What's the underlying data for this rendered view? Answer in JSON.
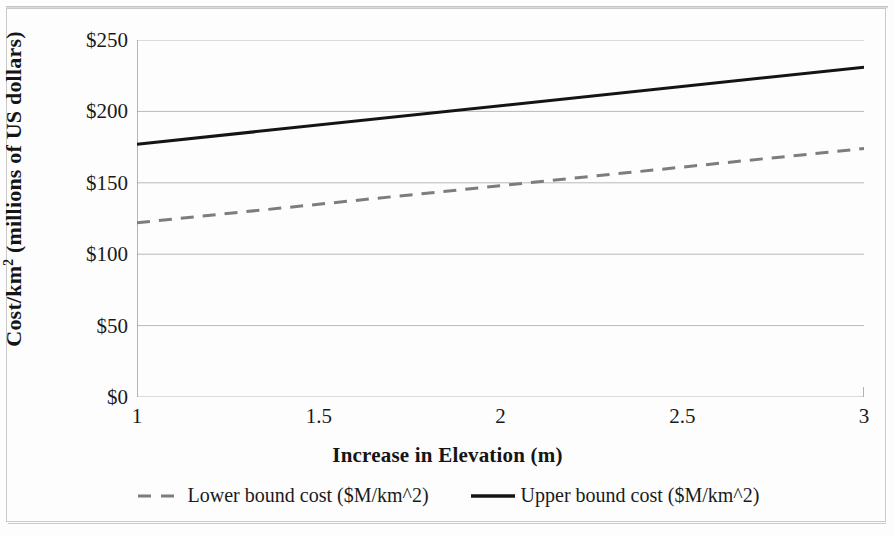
{
  "chart_data": {
    "type": "line",
    "title": "",
    "xlabel": "Increase in Elevation (m)",
    "ylabel": "Cost/km² (millions of US dollars)",
    "ylabel_prefix": "Cost/km",
    "ylabel_superscript": "2",
    "ylabel_suffix": " (millions of US dollars)",
    "x": [
      1,
      3
    ],
    "xlim": [
      1,
      3
    ],
    "ylim": [
      0,
      250
    ],
    "xticks": [
      1,
      1.5,
      2,
      2.5,
      3
    ],
    "xtick_labels": [
      "1",
      "1.5",
      "2",
      "2.5",
      "3"
    ],
    "yticks": [
      0,
      50,
      100,
      150,
      200,
      250
    ],
    "ytick_labels": [
      "$0",
      "$50",
      "$100",
      "$150",
      "$200",
      "$250"
    ],
    "grid": "horizontal",
    "legend_position": "bottom",
    "series": [
      {
        "name": "Lower bound cost ($M/km^2)",
        "values": [
          122,
          174
        ],
        "style": "dashed",
        "color": "#7d7d7d",
        "width": 3
      },
      {
        "name": "Upper bound cost ($M/km^2)",
        "values": [
          177,
          231
        ],
        "style": "solid",
        "color": "#141414",
        "width": 3
      }
    ]
  },
  "colors": {
    "grid": "#b9b9b9",
    "axis": "#8d8d8d",
    "lower_bound": "#7d7d7d",
    "upper_bound": "#141414",
    "frame": "#c9c9c9",
    "background": "#fdfdfd"
  },
  "axes": {
    "x_title": "Increase in Elevation (m)",
    "y_title": "Cost/km² (millions of US dollars)"
  },
  "legend": {
    "items": [
      {
        "label": "Lower bound cost ($M/km^2)",
        "marker": "dashed-line-swatch"
      },
      {
        "label": "Upper bound cost ($M/km^2)",
        "marker": "solid-line-swatch"
      }
    ]
  }
}
